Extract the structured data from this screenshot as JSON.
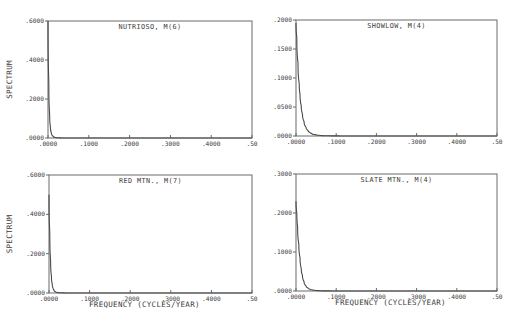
{
  "figure": {
    "background": "#ffffff",
    "ink_color": "#4a4a4a"
  },
  "chart_data": [
    {
      "type": "line",
      "title": "NUTRIOSO, M(6)",
      "xlabel": "",
      "ylabel": "SPECTRUM",
      "xlim": [
        0,
        0.5
      ],
      "ylim": [
        0,
        0.6
      ],
      "x_ticks": [
        ".0000",
        ".1000",
        ".2000",
        ".3000",
        ".4000",
        ".50"
      ],
      "y_ticks": [
        ".0000",
        ".2000",
        ".4000",
        ".6000"
      ],
      "grid": false,
      "legend": null,
      "series": [
        {
          "name": "spectrum",
          "x": [
            0.0,
            0.002,
            0.004,
            0.006,
            0.008,
            0.01,
            0.013,
            0.016,
            0.02,
            0.025,
            0.03,
            0.04,
            0.06,
            0.1,
            0.2,
            0.3,
            0.4,
            0.5
          ],
          "y": [
            0.6,
            0.28,
            0.12,
            0.055,
            0.028,
            0.015,
            0.008,
            0.004,
            0.002,
            0.001,
            0.0006,
            0.0003,
            0.0001,
            0.0,
            0.0,
            0.0,
            0.0,
            0.0
          ]
        }
      ],
      "frame_px": {
        "left": 48,
        "top": 21,
        "right": 252,
        "bottom": 138
      }
    },
    {
      "type": "line",
      "title": "SHOWLOW, M(4)",
      "xlabel": "",
      "ylabel": "",
      "xlim": [
        0,
        0.5
      ],
      "ylim": [
        0,
        0.2
      ],
      "x_ticks": [
        ".0000",
        ".1000",
        ".2000",
        ".3000",
        ".4000",
        ".50"
      ],
      "y_ticks": [
        ".0000",
        ".0500",
        ".1000",
        ".1500",
        ".2000"
      ],
      "grid": false,
      "legend": null,
      "series": [
        {
          "name": "spectrum",
          "x": [
            0.0,
            0.002,
            0.005,
            0.008,
            0.01,
            0.013,
            0.016,
            0.02,
            0.025,
            0.03,
            0.035,
            0.04,
            0.05,
            0.06,
            0.08,
            0.1,
            0.2,
            0.3,
            0.4,
            0.5
          ],
          "y": [
            0.195,
            0.17,
            0.125,
            0.09,
            0.072,
            0.052,
            0.038,
            0.025,
            0.015,
            0.0095,
            0.006,
            0.004,
            0.002,
            0.001,
            0.0004,
            0.0002,
            0.0,
            0.0,
            0.0,
            0.0
          ]
        }
      ],
      "frame_px": {
        "left": 296,
        "top": 20,
        "right": 497,
        "bottom": 136
      }
    },
    {
      "type": "line",
      "title": "RED MTN., M(7)",
      "xlabel": "FREQUENCY (CYCLES/YEAR)",
      "ylabel": "SPECTRUM",
      "xlim": [
        0,
        0.5
      ],
      "ylim": [
        0,
        0.6
      ],
      "x_ticks": [
        ".0000",
        ".1000",
        ".2000",
        ".3000",
        ".4000",
        ".50"
      ],
      "y_ticks": [
        ".0000",
        ".2000",
        ".4000",
        ".6000"
      ],
      "grid": false,
      "legend": null,
      "series": [
        {
          "name": "spectrum",
          "x": [
            0.0,
            0.002,
            0.004,
            0.006,
            0.008,
            0.01,
            0.013,
            0.016,
            0.02,
            0.025,
            0.03,
            0.04,
            0.06,
            0.1,
            0.2,
            0.3,
            0.4,
            0.5
          ],
          "y": [
            0.5,
            0.3,
            0.16,
            0.085,
            0.045,
            0.025,
            0.012,
            0.006,
            0.003,
            0.0015,
            0.0008,
            0.0003,
            0.0001,
            0.0,
            0.0,
            0.0,
            0.0,
            0.0
          ]
        }
      ],
      "frame_px": {
        "left": 49,
        "top": 175,
        "right": 252,
        "bottom": 293
      }
    },
    {
      "type": "line",
      "title": "SLATE MTN., M(4)",
      "xlabel": "FREQUENCY (CYCLES/YEAR)",
      "ylabel": "",
      "xlim": [
        0,
        0.5
      ],
      "ylim": [
        0,
        0.3
      ],
      "x_ticks": [
        ".0000",
        ".1000",
        ".2000",
        ".3000",
        ".4000",
        ".50"
      ],
      "y_ticks": [
        ".0000",
        ".1000",
        ".2000",
        ".3000"
      ],
      "grid": false,
      "legend": null,
      "series": [
        {
          "name": "spectrum",
          "x": [
            0.0,
            0.002,
            0.004,
            0.007,
            0.01,
            0.013,
            0.016,
            0.02,
            0.025,
            0.03,
            0.035,
            0.04,
            0.05,
            0.06,
            0.08,
            0.1,
            0.2,
            0.3,
            0.4,
            0.5
          ],
          "y": [
            0.23,
            0.2,
            0.165,
            0.12,
            0.085,
            0.058,
            0.04,
            0.024,
            0.013,
            0.0075,
            0.0045,
            0.003,
            0.0015,
            0.0008,
            0.0003,
            0.0001,
            0.0,
            0.0,
            0.0,
            0.0
          ]
        }
      ],
      "frame_px": {
        "left": 296,
        "top": 174,
        "right": 497,
        "bottom": 291
      }
    }
  ]
}
